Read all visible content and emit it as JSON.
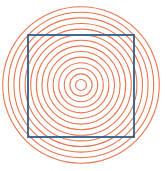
{
  "figure": {
    "kind": "optical-illusion",
    "width": 166,
    "height": 171,
    "background": "#ffffff"
  },
  "circles": {
    "center_x": 81,
    "center_y": 85,
    "count": 14,
    "inner_radius": 5.5,
    "spacing": 5.6,
    "stroke_color": "#e8764f",
    "stroke_width": 1.1
  },
  "square": {
    "x": 28,
    "y": 35,
    "width": 106,
    "height": 102,
    "stroke_color": "#2d5e8e",
    "stroke_width": 1.8
  }
}
